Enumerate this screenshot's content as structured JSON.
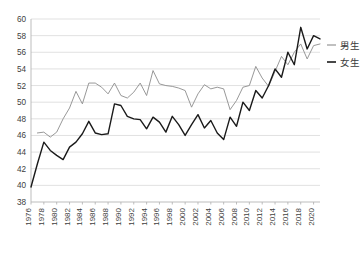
{
  "chart_data": {
    "type": "line",
    "title": "",
    "subtitle": "",
    "xlabel": "",
    "ylabel": "",
    "ylim": [
      38,
      60
    ],
    "ytick_step": 2,
    "yticks": [
      38,
      40,
      42,
      44,
      46,
      48,
      50,
      52,
      54,
      56,
      58,
      60
    ],
    "xlim": [
      1976,
      2021
    ],
    "xtick_step": 2,
    "xticks": [
      1976,
      1978,
      1980,
      1982,
      1984,
      1986,
      1988,
      1990,
      1992,
      1994,
      1996,
      1998,
      2000,
      2002,
      2004,
      2006,
      2008,
      2010,
      2012,
      2014,
      2016,
      2018,
      2020
    ],
    "grid": true,
    "grid_axis": "y",
    "legend_position": "right",
    "x": [
      1976,
      1977,
      1978,
      1979,
      1980,
      1981,
      1982,
      1983,
      1984,
      1985,
      1986,
      1987,
      1988,
      1989,
      1990,
      1991,
      1992,
      1993,
      1994,
      1995,
      1996,
      1997,
      1998,
      1999,
      2000,
      2001,
      2002,
      2003,
      2004,
      2005,
      2006,
      2007,
      2008,
      2009,
      2010,
      2011,
      2012,
      2013,
      2014,
      2015,
      2016,
      2017,
      2018,
      2019,
      2020,
      2021
    ],
    "series": [
      {
        "name": "男生",
        "color": "#8c8c8c",
        "width": 0.9,
        "values": [
          null,
          46.3,
          46.4,
          45.8,
          46.4,
          48.0,
          49.3,
          51.3,
          49.8,
          52.3,
          52.3,
          51.8,
          51.0,
          52.3,
          50.8,
          50.5,
          51.2,
          52.3,
          50.8,
          53.8,
          52.2,
          52.0,
          51.9,
          51.7,
          51.4,
          49.4,
          51.0,
          52.1,
          51.6,
          51.8,
          51.6,
          49.1,
          50.2,
          51.8,
          52.0,
          54.3,
          52.9,
          51.9,
          53.7,
          55.5,
          54.5,
          56.0,
          57.0,
          55.2,
          56.8,
          57.0
        ]
      },
      {
        "name": "女生",
        "color": "#1a1a1a",
        "width": 1.4,
        "values": [
          39.8,
          42.6,
          45.2,
          44.2,
          43.6,
          43.1,
          44.6,
          45.2,
          46.2,
          47.7,
          46.3,
          46.1,
          46.2,
          49.8,
          49.6,
          48.3,
          48.0,
          47.9,
          46.8,
          48.2,
          47.6,
          46.4,
          48.3,
          47.3,
          46.0,
          47.3,
          48.5,
          46.9,
          47.8,
          46.3,
          45.5,
          48.2,
          47.1,
          50.0,
          49.0,
          51.4,
          50.5,
          52.0,
          54.0,
          53.0,
          56.0,
          54.5,
          59.0,
          56.4,
          58.0,
          57.6
        ]
      }
    ]
  },
  "legend": {
    "items": [
      {
        "label": "男生"
      },
      {
        "label": "女生"
      }
    ]
  }
}
